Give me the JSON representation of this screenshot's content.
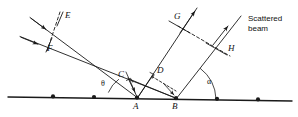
{
  "figure": {
    "type": "line-diagram",
    "width": 298,
    "height": 117,
    "background": "#ffffff",
    "stroke": "#1a1a1a"
  },
  "labels": {
    "point_E": "E",
    "point_F": "F",
    "point_G": "G",
    "point_H": "H",
    "point_C": "C",
    "point_D": "D",
    "point_A": "A",
    "point_B": "B",
    "angle_theta": "θ",
    "angle_alpha": "α"
  },
  "annotations": {
    "scattered_beam_line1": "Scattered",
    "scattered_beam_line2": "beam"
  },
  "geometry": {
    "atom_row": {
      "x1": 8,
      "y1": 97,
      "x2": 292,
      "y2": 101
    },
    "atoms": [
      {
        "name": "atom-1",
        "x": 53,
        "y": 96.3
      },
      {
        "name": "atom-2",
        "x": 94,
        "y": 97.0
      },
      {
        "name": "atom-A",
        "x": 137,
        "y": 97.5
      },
      {
        "name": "atom-B",
        "x": 176,
        "y": 98.1
      },
      {
        "name": "atom-3",
        "x": 217,
        "y": 98.7
      },
      {
        "name": "atom-4",
        "x": 258,
        "y": 99.3
      }
    ],
    "incident_ray_upper": {
      "x1": 32,
      "y1": 18,
      "x2": 137,
      "y2": 97.5
    },
    "incident_ray_lower": {
      "x1": 22,
      "y1": 37,
      "x2": 176,
      "y2": 98.1
    },
    "scattered_ray_from_A": {
      "x1": 137,
      "y1": 97.5,
      "x2": 196,
      "y2": 10
    },
    "scattered_ray_from_B": {
      "x1": 176,
      "y1": 98.1,
      "x2": 240,
      "y2": 18
    },
    "wavefront_in": {
      "x1": 48,
      "y1": 14,
      "x2": 38,
      "y2": 45
    },
    "wavefront_out": {
      "x1": 178,
      "y1": 26,
      "x2": 224,
      "y2": 52
    },
    "segment_AC": {
      "x1": 137,
      "y1": 97.5,
      "x2": 129,
      "y2": 79
    },
    "segment_AD": {
      "x1": 137,
      "y1": 97.5,
      "x2": 152,
      "y2": 76
    },
    "segment_BC": {
      "x1": 176,
      "y1": 98.1,
      "x2": 129,
      "y2": 79
    },
    "segment_BD": {
      "x1": 176,
      "y1": 98.1,
      "x2": 152,
      "y2": 76
    },
    "theta_arc": {
      "cx": 137,
      "cy": 97.5,
      "r": 33,
      "from_deg": 180,
      "to_deg": 217
    },
    "alpha_arc": {
      "cx": 176,
      "cy": 98.1,
      "r": 40,
      "from_deg": 0,
      "to_deg": -54
    }
  },
  "label_positions": {
    "point_E": {
      "x": 65,
      "y": 16
    },
    "point_F": {
      "x": 43,
      "y": 46
    },
    "point_G": {
      "x": 175,
      "y": 14
    },
    "point_H": {
      "x": 226,
      "y": 45
    },
    "point_C": {
      "x": 121,
      "y": 73
    },
    "point_D": {
      "x": 157,
      "y": 70
    },
    "point_A": {
      "x": 133,
      "y": 103
    },
    "point_B": {
      "x": 172,
      "y": 103
    },
    "angle_theta": {
      "x": 102,
      "y": 83
    },
    "angle_alpha": {
      "x": 208,
      "y": 80
    },
    "scattered_beam": {
      "x": 249,
      "y": 18
    }
  }
}
